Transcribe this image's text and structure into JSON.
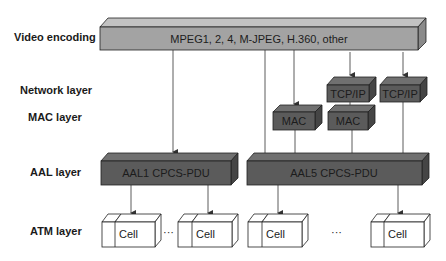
{
  "layers": {
    "video_encoding": "Video encoding",
    "network": "Network layer",
    "mac": "MAC layer",
    "aal": "AAL layer",
    "atm": "ATM layer"
  },
  "boxes": {
    "video": "MPEG1, 2, 4, M-JPEG, H.360, other",
    "tcpip_1": "TCP/IP",
    "tcpip_2": "TCP/IP",
    "mac_1": "MAC",
    "mac_2": "MAC",
    "aal1": "AAL1 CPCS-PDU",
    "aal5": "AAL5 CPCS-PDU"
  },
  "cells": [
    "Cell",
    "Cell",
    "Cell",
    "Cell"
  ],
  "ellipsis": "···",
  "colors": {
    "video_fill": "#a3a3a3",
    "video_top": "#c2c2c2",
    "video_side": "#8a8a8a",
    "dark_fill": "#5b5b5b",
    "dark_top": "#707070",
    "dark_side": "#454545",
    "line": "#333333"
  }
}
